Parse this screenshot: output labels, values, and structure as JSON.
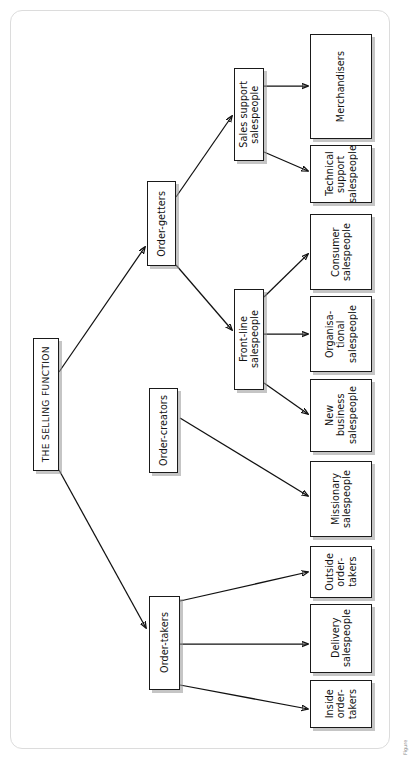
{
  "figure": {
    "orientation": "rotated-90-ccw",
    "caption_fragment": "Figure",
    "root": {
      "label": "THE SELLING FUNCTION"
    },
    "level2": [
      {
        "id": "order-getters",
        "label": "Order-getters"
      },
      {
        "id": "order-creators",
        "label": "Order-creators"
      },
      {
        "id": "order-takers",
        "label": "Order-takers"
      }
    ],
    "level3": [
      {
        "id": "sales-support-salespeople",
        "label": "Sales support\nsalespeople"
      },
      {
        "id": "front-line-salespeople",
        "label": "Front-line\nsalespeople"
      }
    ],
    "leaves": [
      {
        "id": "merchandisers",
        "label": "Merchandisers"
      },
      {
        "id": "technical-support-salespeople",
        "label": "Technical\nsupport\nsalespeople"
      },
      {
        "id": "consumer-salespeople",
        "label": "Consumer\nsalespeople"
      },
      {
        "id": "organisational-salespeople",
        "label": "Organisa-\ntional\nsalespeople"
      },
      {
        "id": "new-business-salespeople",
        "label": "New\nbusiness\nsalespeople"
      },
      {
        "id": "missionary-salespeople",
        "label": "Missionary\nsalespeople"
      },
      {
        "id": "outside-order-takers",
        "label": "Outside\norder-\ntakers"
      },
      {
        "id": "delivery-salespeople",
        "label": "Delivery\nsalespeople"
      },
      {
        "id": "inside-order-takers",
        "label": "Inside\norder-\ntakers"
      }
    ],
    "edges": [
      {
        "from": "root",
        "to": "order-getters"
      },
      {
        "from": "root",
        "to": "order-takers"
      },
      {
        "from": "order-getters",
        "to": "sales-support-salespeople"
      },
      {
        "from": "order-getters",
        "to": "front-line-salespeople"
      },
      {
        "from": "sales-support-salespeople",
        "to": "merchandisers"
      },
      {
        "from": "sales-support-salespeople",
        "to": "technical-support-salespeople"
      },
      {
        "from": "front-line-salespeople",
        "to": "consumer-salespeople"
      },
      {
        "from": "front-line-salespeople",
        "to": "organisational-salespeople"
      },
      {
        "from": "front-line-salespeople",
        "to": "new-business-salespeople"
      },
      {
        "from": "order-creators",
        "to": "missionary-salespeople"
      },
      {
        "from": "order-takers",
        "to": "outside-order-takers"
      },
      {
        "from": "order-takers",
        "to": "delivery-salespeople"
      },
      {
        "from": "order-takers",
        "to": "inside-order-takers"
      }
    ],
    "colors": {
      "box_border": "#1a1a1a",
      "box_fill": "#ffffff",
      "shadow": "#969696",
      "card_border": "#dcdcdc",
      "text": "#111111"
    }
  }
}
